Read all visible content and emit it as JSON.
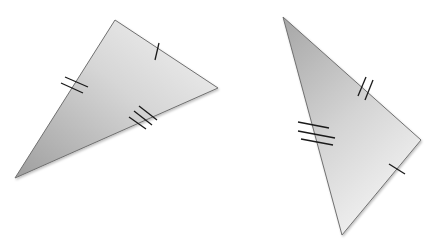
{
  "diagram": {
    "colors": {
      "fill_light": "#f2f2f2",
      "fill_dark": "#a8a8a8",
      "stroke": "#6e6e6e",
      "tick": "#1a1a1a"
    },
    "triangles": [
      {
        "name": "left-triangle",
        "vertices": [
          [
            115,
            20
          ],
          [
            218,
            88
          ],
          [
            15,
            178
          ]
        ],
        "tick_marks": [
          {
            "side": "top-right",
            "count": 1
          },
          {
            "side": "left",
            "count": 2
          },
          {
            "side": "bottom",
            "count": 3
          }
        ]
      },
      {
        "name": "right-triangle",
        "vertices": [
          [
            283,
            17
          ],
          [
            421,
            140
          ],
          [
            342,
            235
          ]
        ],
        "tick_marks": [
          {
            "side": "top-right",
            "count": 2
          },
          {
            "side": "left",
            "count": 3
          },
          {
            "side": "bottom-right",
            "count": 1
          }
        ]
      }
    ]
  }
}
